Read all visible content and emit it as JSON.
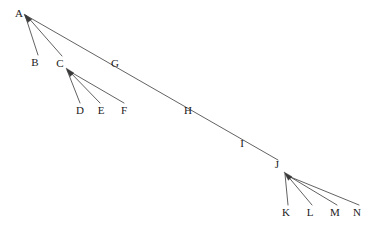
{
  "diagram": {
    "type": "directed-tree",
    "width": 384,
    "height": 228,
    "background_color": "#ffffff",
    "line_color": "#3a3a3a",
    "label_color": "#1a1a1a",
    "line_width": 0.8,
    "font_size": 11,
    "nodes": [
      {
        "id": "A",
        "label": "A",
        "x": 19,
        "y": 13
      },
      {
        "id": "B",
        "label": "B",
        "x": 35,
        "y": 62
      },
      {
        "id": "C",
        "label": "C",
        "x": 60,
        "y": 63
      },
      {
        "id": "D",
        "label": "D",
        "x": 80,
        "y": 110
      },
      {
        "id": "E",
        "label": "E",
        "x": 101,
        "y": 110
      },
      {
        "id": "F",
        "label": "F",
        "x": 124,
        "y": 110
      },
      {
        "id": "G",
        "label": "G",
        "x": 115,
        "y": 63
      },
      {
        "id": "H",
        "label": "H",
        "x": 188,
        "y": 110
      },
      {
        "id": "I",
        "label": "I",
        "x": 242,
        "y": 143
      },
      {
        "id": "J",
        "label": "J",
        "x": 277,
        "y": 164
      },
      {
        "id": "K",
        "label": "K",
        "x": 286,
        "y": 212
      },
      {
        "id": "L",
        "label": "L",
        "x": 310,
        "y": 212
      },
      {
        "id": "M",
        "label": "M",
        "x": 335,
        "y": 212
      },
      {
        "id": "N",
        "label": "N",
        "x": 357,
        "y": 212
      }
    ],
    "hubs": [
      {
        "id": "A",
        "tip_x": 24,
        "tip_y": 14,
        "arrowhead": true
      },
      {
        "id": "C",
        "tip_x": 66,
        "tip_y": 68,
        "arrowhead": true
      },
      {
        "id": "J",
        "tip_x": 284,
        "tip_y": 172,
        "arrowhead": true
      }
    ],
    "edges": [
      {
        "from": "B",
        "to": "A",
        "x1": 38,
        "y1": 55,
        "x2": 25,
        "y2": 15,
        "arrow": true
      },
      {
        "from": "C",
        "to": "A",
        "x1": 62,
        "y1": 56,
        "x2": 26,
        "y2": 15,
        "arrow": true
      },
      {
        "from": "J",
        "to": "A",
        "x1": 278,
        "y1": 160,
        "x2": 27,
        "y2": 16,
        "arrow": true
      },
      {
        "from": "D",
        "to": "C",
        "x1": 80,
        "y1": 103,
        "x2": 67,
        "y2": 70,
        "arrow": true
      },
      {
        "from": "E",
        "to": "C",
        "x1": 100,
        "y1": 103,
        "x2": 68,
        "y2": 70,
        "arrow": true
      },
      {
        "from": "F",
        "to": "C",
        "x1": 124,
        "y1": 103,
        "x2": 69,
        "y2": 71,
        "arrow": true
      },
      {
        "from": "K",
        "to": "J",
        "x1": 288,
        "y1": 205,
        "x2": 285,
        "y2": 174,
        "arrow": true
      },
      {
        "from": "L",
        "to": "J",
        "x1": 312,
        "y1": 205,
        "x2": 286,
        "y2": 174,
        "arrow": true
      },
      {
        "from": "M",
        "to": "J",
        "x1": 337,
        "y1": 205,
        "x2": 287,
        "y2": 175,
        "arrow": true
      },
      {
        "from": "N",
        "to": "J",
        "x1": 359,
        "y1": 205,
        "x2": 288,
        "y2": 176,
        "arrow": true
      }
    ],
    "edge_labels_on_path": [
      "G",
      "H",
      "I"
    ]
  }
}
